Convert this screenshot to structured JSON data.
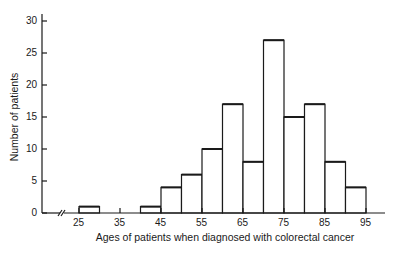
{
  "chart_data": {
    "type": "bar",
    "subtype": "histogram",
    "title": "",
    "xlabel": "Ages of patients when diagnosed with colorectal cancer",
    "ylabel": "Number of patients",
    "bin_width": 5,
    "bins": [
      {
        "start": 25,
        "end": 30,
        "value": 1
      },
      {
        "start": 30,
        "end": 35,
        "value": 0
      },
      {
        "start": 35,
        "end": 40,
        "value": 0
      },
      {
        "start": 40,
        "end": 45,
        "value": 1
      },
      {
        "start": 45,
        "end": 50,
        "value": 4
      },
      {
        "start": 50,
        "end": 55,
        "value": 6
      },
      {
        "start": 55,
        "end": 60,
        "value": 10
      },
      {
        "start": 60,
        "end": 65,
        "value": 17
      },
      {
        "start": 65,
        "end": 70,
        "value": 8
      },
      {
        "start": 70,
        "end": 75,
        "value": 27
      },
      {
        "start": 75,
        "end": 80,
        "value": 15
      },
      {
        "start": 80,
        "end": 85,
        "value": 17
      },
      {
        "start": 85,
        "end": 90,
        "value": 8
      },
      {
        "start": 90,
        "end": 95,
        "value": 4
      }
    ],
    "categories": [
      "25-30",
      "30-35",
      "35-40",
      "40-45",
      "45-50",
      "50-55",
      "55-60",
      "60-65",
      "65-70",
      "70-75",
      "75-80",
      "80-85",
      "85-90",
      "90-95"
    ],
    "values": [
      1,
      0,
      0,
      1,
      4,
      6,
      10,
      17,
      8,
      27,
      15,
      17,
      8,
      4
    ],
    "x_ticks": [
      25,
      35,
      45,
      55,
      65,
      75,
      85,
      95
    ],
    "y_ticks": [
      0,
      5,
      10,
      15,
      20,
      25,
      30
    ],
    "ylim": [
      0,
      30
    ],
    "xlim": [
      25,
      95
    ],
    "axis_break": true,
    "grid": false,
    "legend": null,
    "colors": {
      "bar_fill": "#ffffff",
      "bar_stroke": "#1a1a1a",
      "axis": "#1a1a1a"
    }
  },
  "labels": {
    "x_axis": "Ages of patients when diagnosed with colorectal cancer",
    "y_axis": "Number of patients"
  }
}
